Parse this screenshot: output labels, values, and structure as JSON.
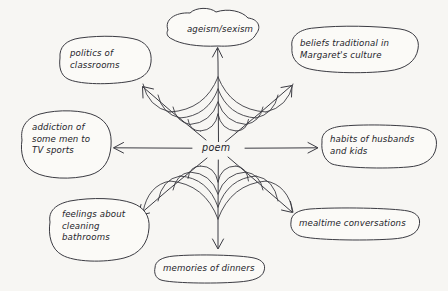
{
  "diagram": {
    "type": "spider-web-concept-map",
    "title": "",
    "background_color": "#f7f6f3",
    "ink_color": "#3b3b42",
    "center": {
      "label": "poem",
      "x": 218,
      "y": 148
    },
    "web": {
      "spoke_count": 8,
      "ring_count": 4,
      "arrowheads": true
    },
    "nodes": [
      {
        "id": "ageism-sexism",
        "label": "ageism/sexism",
        "shape": "cloud-blob",
        "direction": "up",
        "angle_deg": 270,
        "x": 160,
        "y": 13,
        "w": 100,
        "h": 34,
        "lines": [
          "ageism/sexism"
        ]
      },
      {
        "id": "beliefs-traditional",
        "label": "beliefs traditional in Margaret's culture",
        "shape": "rounded-blob",
        "direction": "up-right",
        "angle_deg": 315,
        "x": 288,
        "y": 30,
        "w": 128,
        "h": 42,
        "lines": [
          "beliefs traditional in",
          "Margaret's culture"
        ]
      },
      {
        "id": "habits-husbands-kids",
        "label": "habits of husbands and kids",
        "shape": "rounded-blob",
        "direction": "right",
        "angle_deg": 0,
        "x": 318,
        "y": 126,
        "w": 112,
        "h": 42,
        "lines": [
          "habits of husbands",
          "and kids"
        ]
      },
      {
        "id": "mealtime-conversations",
        "label": "mealtime conversations",
        "shape": "flat-oval",
        "direction": "down-right",
        "angle_deg": 45,
        "x": 288,
        "y": 212,
        "w": 126,
        "h": 26,
        "lines": [
          "mealtime conversations"
        ]
      },
      {
        "id": "memories-of-dinners",
        "label": "memories of dinners",
        "shape": "flat-oval",
        "direction": "down",
        "angle_deg": 90,
        "x": 152,
        "y": 256,
        "w": 110,
        "h": 25,
        "lines": [
          "memories of dinners"
        ]
      },
      {
        "id": "feelings-cleaning-bathrooms",
        "label": "feelings about cleaning bathrooms",
        "shape": "rounded-blob",
        "direction": "down-left",
        "angle_deg": 135,
        "x": 46,
        "y": 202,
        "w": 106,
        "h": 58,
        "lines": [
          "feelings about",
          "cleaning",
          "bathrooms"
        ]
      },
      {
        "id": "addiction-tv-sports",
        "label": "addiction of some men to TV sports",
        "shape": "rounded-blob",
        "direction": "left",
        "angle_deg": 180,
        "x": 20,
        "y": 114,
        "w": 92,
        "h": 62,
        "lines": [
          "addiction of",
          "some men to",
          "TV sports"
        ]
      },
      {
        "id": "politics-of-classrooms",
        "label": "politics of classrooms",
        "shape": "rounded-blob",
        "direction": "up-left",
        "angle_deg": 225,
        "x": 56,
        "y": 38,
        "w": 90,
        "h": 44,
        "lines": [
          "politics of",
          "classrooms"
        ]
      }
    ]
  }
}
